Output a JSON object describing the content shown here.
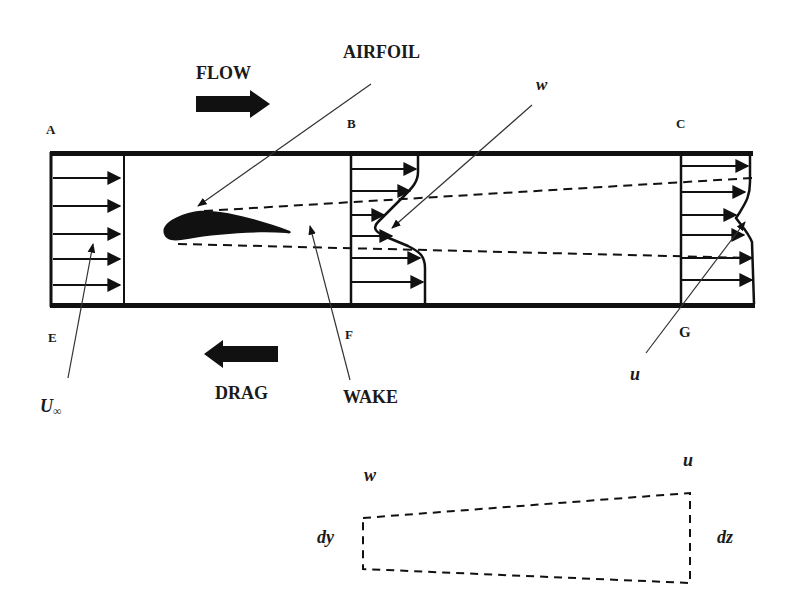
{
  "diagram": {
    "type": "wind-tunnel wake survey schematic",
    "labels": {
      "flow": "FLOW",
      "airfoil": "AIRFOIL",
      "drag": "DRAG",
      "wake": "WAKE",
      "w_top": "w",
      "u_bottom": "u",
      "u_inf_base": "U",
      "u_inf_sub": "∞",
      "station_a": "A",
      "station_b": "B",
      "station_c": "C",
      "station_e": "E",
      "station_f": "F",
      "station_g": "G"
    },
    "control_volume": {
      "w_label": "w",
      "u_label": "u",
      "dy_label": "dy",
      "dz_label": "dz"
    },
    "colors": {
      "ink": "#111111",
      "background": "#ffffff"
    }
  }
}
